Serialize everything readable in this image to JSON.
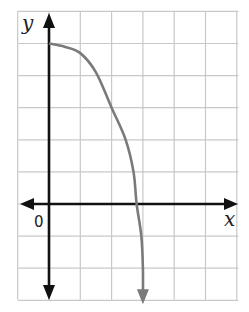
{
  "chart_data": {
    "type": "line",
    "title": "",
    "xlabel": "x",
    "ylabel": "y",
    "origin_label": "0",
    "xlim": [
      -1,
      6
    ],
    "ylim": [
      -3,
      6
    ],
    "grid": true,
    "grid_step": 1,
    "legend": null,
    "series": [
      {
        "name": "curve",
        "color": "#7a7a7a",
        "arrow_end": "down",
        "points": [
          [
            0,
            5
          ],
          [
            0.5,
            4.9
          ],
          [
            1,
            4.7
          ],
          [
            1.5,
            4.1
          ],
          [
            2,
            3.0
          ],
          [
            2.45,
            2.0
          ],
          [
            2.7,
            1.0
          ],
          [
            2.8,
            0.0
          ],
          [
            2.95,
            -1.0
          ],
          [
            3.0,
            -2.0
          ],
          [
            3.0,
            -3.0
          ]
        ]
      }
    ],
    "colors": {
      "axis": "#111111",
      "grid": "#c8c8c8",
      "curve": "#7a7a7a",
      "background": "#ffffff"
    }
  }
}
